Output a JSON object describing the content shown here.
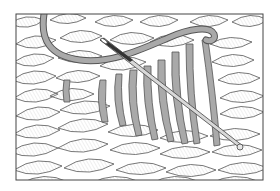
{
  "illustration": {
    "subject": "knitting-duplicate-stitch",
    "colors": {
      "background": "#ffffff",
      "knit_fill": "#f2f2f2",
      "knit_line": "#555555",
      "yarn": "#a9a9a9",
      "yarn_outline": "#555555",
      "needle": "#d8d8d8",
      "frame": "#444444"
    }
  }
}
